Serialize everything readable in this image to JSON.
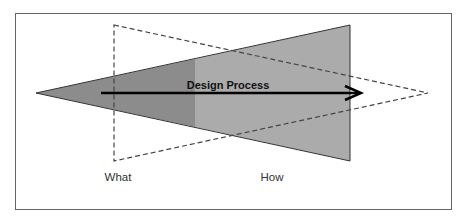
{
  "diagram": {
    "arrow_label": "Design Process",
    "labels": {
      "what": "What",
      "how": "How"
    },
    "colors": {
      "frame": "#666666",
      "dark_fill": "#8c8c8c",
      "light_fill": "#ababab",
      "outline": "#333333",
      "arrow": "#000000",
      "dashed": "#444444",
      "background": "#ffffff"
    },
    "shapes": {
      "solid_triangle": "Widening funnel from left tip to right vertical edge (How)",
      "dashed_triangle": "Narrowing funnel from left vertical edge (What) to right tip",
      "arrow": "Horizontal arrow pointing right labeled Design Process"
    }
  }
}
